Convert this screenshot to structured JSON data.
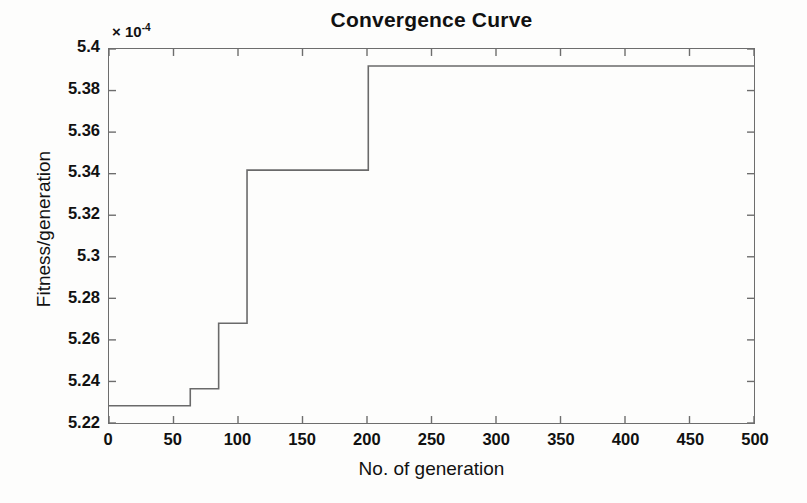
{
  "chart_data": {
    "type": "line",
    "title": "Convergence Curve",
    "xlabel": "No. of generation",
    "ylabel": "Fitness/generation",
    "y_exponent_prefix": "× 10",
    "y_exponent_power": "-4",
    "xlim": [
      0,
      500
    ],
    "ylim": [
      5.22,
      5.4
    ],
    "y_scale_factor": "1e-4",
    "grid": false,
    "legend": false,
    "tick_direction": "in",
    "line_color": "#6a6a6a",
    "line_width": 1.6,
    "drawstyle": "steps-post",
    "xticks": [
      0,
      50,
      100,
      150,
      200,
      250,
      300,
      350,
      400,
      450,
      500
    ],
    "xtick_labels": [
      "0",
      "50",
      "100",
      "150",
      "200",
      "250",
      "300",
      "350",
      "400",
      "450",
      "500"
    ],
    "yticks": [
      5.22,
      5.24,
      5.26,
      5.28,
      5.3,
      5.32,
      5.34,
      5.36,
      5.38,
      5.4
    ],
    "ytick_labels": [
      "5.22",
      "5.24",
      "5.26",
      "5.28",
      "5.3",
      "5.32",
      "5.34",
      "5.36",
      "5.38",
      "5.4"
    ],
    "series": [
      {
        "name": "Best fitness",
        "x": [
          0,
          63,
          63,
          85,
          85,
          107,
          107,
          201,
          201,
          500
        ],
        "y": [
          5.2283,
          5.2283,
          5.2365,
          5.2365,
          5.268,
          5.268,
          5.3417,
          5.3417,
          5.3918,
          5.3918
        ]
      }
    ],
    "steps": [
      {
        "generation": 0,
        "fitness": 5.2283
      },
      {
        "generation": 63,
        "fitness": 5.2365
      },
      {
        "generation": 85,
        "fitness": 5.268
      },
      {
        "generation": 107,
        "fitness": 5.3417
      },
      {
        "generation": 201,
        "fitness": 5.3918
      },
      {
        "generation": 500,
        "fitness": 5.3918
      }
    ]
  },
  "colors": {
    "line": "#6a6a6a",
    "axis": "#6d6d6d",
    "text": "#111111",
    "background": "#fdfdfc"
  }
}
